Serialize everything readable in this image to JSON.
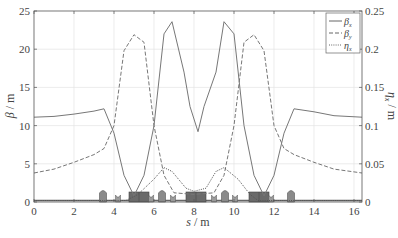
{
  "chart_data": {
    "type": "line",
    "title": "",
    "xlabel": "s / m",
    "ylabel": "β / m",
    "y2label": "η_x / m",
    "xlim": [
      0,
      16.4
    ],
    "ylim": [
      0,
      25
    ],
    "y2lim": [
      0,
      0.25
    ],
    "grid": true,
    "legend_position": "upper right",
    "x_ticks": [
      "0",
      "2",
      "4",
      "6",
      "8",
      "10",
      "12",
      "14",
      "16"
    ],
    "y_ticks": [
      "0",
      "5",
      "10",
      "15",
      "20",
      "25"
    ],
    "y2_ticks": [
      "0",
      "0.05",
      "0.1",
      "0.15",
      "0.2",
      "0.25"
    ],
    "legend": [
      {
        "name": "β_x",
        "style": "solid"
      },
      {
        "name": "β_y",
        "style": "dashed"
      },
      {
        "name": "η_x",
        "style": "dotted"
      }
    ],
    "series": [
      {
        "name": "β_x",
        "axis": "left",
        "style": "solid",
        "x": [
          0,
          1,
          2,
          3,
          3.5,
          4.0,
          4.5,
          5.0,
          5.5,
          6.0,
          6.5,
          6.9,
          7.5,
          7.8,
          8.2,
          8.5,
          9.1,
          9.5,
          10.0,
          10.5,
          11.0,
          11.5,
          12.0,
          12.5,
          13.0,
          14,
          15,
          16.4
        ],
        "y": [
          11.1,
          11.2,
          11.5,
          11.9,
          12.2,
          9.0,
          3.5,
          0.8,
          3.5,
          10.0,
          22.0,
          23.6,
          17.0,
          12.5,
          9.2,
          12.5,
          17.0,
          23.6,
          22.0,
          10.0,
          3.5,
          0.8,
          3.5,
          9.0,
          12.2,
          11.8,
          11.3,
          11.1
        ]
      },
      {
        "name": "β_y",
        "axis": "left",
        "style": "dashed",
        "x": [
          0,
          1,
          2,
          3,
          3.5,
          4.0,
          4.5,
          5.0,
          5.5,
          6.0,
          6.5,
          7.0,
          8.0,
          9.0,
          9.5,
          10.0,
          10.5,
          11.0,
          11.5,
          12.0,
          12.5,
          13.0,
          14,
          15,
          16.4
        ],
        "y": [
          3.8,
          4.3,
          5.2,
          6.2,
          7.0,
          10.0,
          19.8,
          21.9,
          20.9,
          10.0,
          3.5,
          1.2,
          1.0,
          1.2,
          3.5,
          10.0,
          20.9,
          21.9,
          19.8,
          10.0,
          7.0,
          6.2,
          5.2,
          4.3,
          3.8
        ]
      },
      {
        "name": "η_x",
        "axis": "right",
        "style": "dotted",
        "x": [
          0,
          4.6,
          5.2,
          6.0,
          6.5,
          6.9,
          7.6,
          8.0,
          8.6,
          9.1,
          9.5,
          10.2,
          10.8,
          11.2,
          16.4
        ],
        "y": [
          0.002,
          0.002,
          0.01,
          0.03,
          0.045,
          0.04,
          0.018,
          0.014,
          0.018,
          0.04,
          0.045,
          0.03,
          0.01,
          0.002,
          0.002
        ]
      }
    ],
    "annotations": "Lattice element symbols drawn along the bottom axis (dipoles as dark rectangles near s≈5, 8, 11.3; quadrupoles/sextupoles as small rounded shapes)"
  },
  "lattice": {
    "dipoles": [
      [
        4.75,
        5.75
      ],
      [
        7.6,
        8.6
      ],
      [
        10.75,
        11.75
      ]
    ],
    "quads": [
      3.45,
      6.4,
      9.55,
      12.85
    ],
    "sextupoles_small": [
      4.2,
      5.85,
      6.95,
      9.0,
      10.05,
      11.85
    ],
    "thin_small": [
      6.9,
      9.1
    ]
  }
}
